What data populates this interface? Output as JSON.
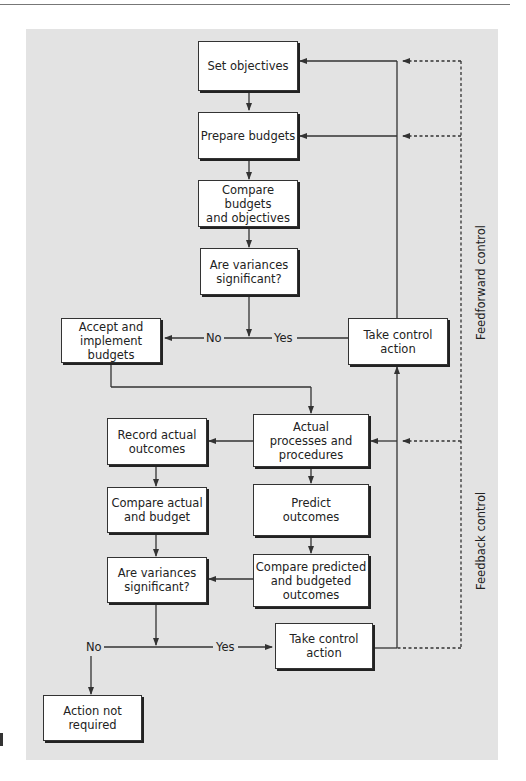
{
  "diagram": {
    "boxes": {
      "set_objectives": "Set objectives",
      "prepare_budgets": "Prepare budgets",
      "compare_budgets_objectives": "Compare budgets\nand objectives",
      "variances_significant_1": "Are variances\nsignificant?",
      "accept_implement": "Accept and\nimplement\nbudgets",
      "take_control_action_1": "Take control\naction",
      "actual_processes": "Actual\nprocesses and\nprocedures",
      "record_actual": "Record actual\noutcomes",
      "compare_actual_budget": "Compare actual\nand budget",
      "predict_outcomes": "Predict\noutcomes",
      "variances_significant_2": "Are variances\nsignificant?",
      "compare_predicted_budgeted": "Compare predicted\nand budgeted\noutcomes",
      "take_control_action_2": "Take control\naction",
      "action_not_required": "Action not\nrequired"
    },
    "labels": {
      "no_1": "No",
      "yes_1": "Yes",
      "no_2": "No",
      "yes_2": "Yes",
      "feedforward": "Feedforward control",
      "feedback": "Feedback control"
    },
    "colors": {
      "panel": "#e3e3e3",
      "line": "#333333"
    }
  }
}
